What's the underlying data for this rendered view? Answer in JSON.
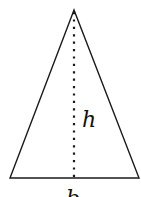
{
  "diagram": {
    "type": "isosceles-triangle-height-base",
    "labels": {
      "height": "h",
      "base": "b"
    },
    "colors": {
      "stroke": "#1a1a1a",
      "background": "#ffffff"
    }
  }
}
